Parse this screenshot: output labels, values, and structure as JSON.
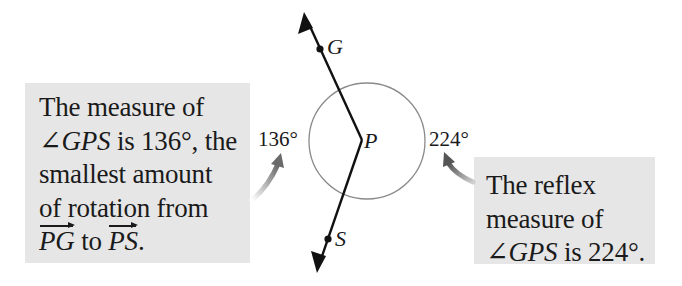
{
  "diagram": {
    "points": {
      "G": {
        "label": "G"
      },
      "P": {
        "label": "P"
      },
      "S": {
        "label": "S"
      }
    },
    "angle_labels": {
      "minor": "136°",
      "reflex": "224°"
    },
    "colors": {
      "callout_bg": "#e6e6e6",
      "line": "#111111",
      "circle": "#8a8a8a",
      "arrow": "#666666"
    }
  },
  "callout_left": {
    "line1": "The measure of",
    "line2_angle": "∠GPS",
    "line2_rest": " is 136°, the",
    "line3": "smallest amount",
    "line4": "of rotation from",
    "line5_ray1": "PG",
    "line5_mid": " to ",
    "line5_ray2": "PS",
    "line5_end": "."
  },
  "callout_right": {
    "line1": "The reflex",
    "line2": "measure of",
    "line3_angle": "∠GPS",
    "line3_rest": " is 224°."
  }
}
